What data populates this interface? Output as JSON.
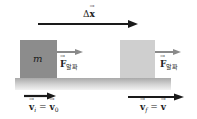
{
  "diagram": {
    "displacement": {
      "symbol": "Δ",
      "var": "x",
      "label_text": "Δx"
    },
    "block_initial": {
      "mass_label": "m",
      "color": "#8c8c8c"
    },
    "block_final": {
      "color": "#cfcfcf"
    },
    "force_initial": {
      "var": "F",
      "subscript": "알짜"
    },
    "force_final": {
      "var": "F",
      "subscript": "알짜"
    },
    "velocity_initial": {
      "lhs_var": "v",
      "lhs_sub": "i",
      "eq": " = ",
      "rhs_var": "v",
      "rhs_sub": "0"
    },
    "velocity_final": {
      "lhs_var": "v",
      "lhs_sub": "f",
      "eq": " = ",
      "rhs_var": "v"
    },
    "colors": {
      "arrow_dark": "#1a1a1a",
      "arrow_force": "#8a8a8a",
      "ground_top": "#a9a9a9"
    }
  }
}
